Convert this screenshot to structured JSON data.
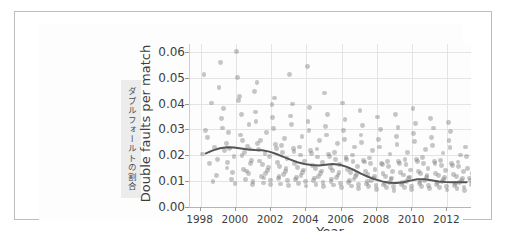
{
  "figure": {
    "side_caption": "ダブルフォールトの割合"
  },
  "chart_data": {
    "type": "scatter",
    "title": "",
    "xlabel": "Year",
    "ylabel": "Double faults per match",
    "xlim": [
      1997.4,
      2013.4
    ],
    "ylim": [
      0.0,
      0.063
    ],
    "grid": true,
    "legend": null,
    "xticks": [
      1998,
      2000,
      2002,
      2004,
      2006,
      2008,
      2010,
      2012
    ],
    "xtick_labels": [
      "1998",
      "2000",
      "2002",
      "2004",
      "2006",
      "2008",
      "2010",
      "2012"
    ],
    "yticks": [
      0.0,
      0.01,
      0.02,
      0.03,
      0.04,
      0.05,
      0.06
    ],
    "ytick_labels": [
      "0.00",
      "0.01",
      "0.02",
      "0.03",
      "0.04",
      "0.05",
      "0.06"
    ],
    "marker_color": "#787878",
    "marker_alpha": 0.42,
    "trend_color": "#555555",
    "series": [
      {
        "name": "Double faults per match",
        "x": [
          1998.1,
          1998.3,
          1998.5,
          1998.6,
          1998.8,
          1998.9,
          1998.2,
          1998.7,
          1998.4,
          1998.95,
          1999.05,
          1999.2,
          1999.35,
          1999.5,
          1999.6,
          1999.75,
          1999.9,
          1999.15,
          1999.45,
          1999.8,
          1999.3,
          1999.55,
          1999.95,
          1999.25,
          1999.65,
          2000.05,
          2000.15,
          2000.25,
          2000.35,
          2000.45,
          2000.55,
          2000.65,
          2000.75,
          2000.85,
          2000.95,
          2000.1,
          2000.3,
          2000.5,
          2000.7,
          2000.9,
          2000.2,
          2000.4,
          2000.6,
          2000.8,
          2000.98,
          2001.05,
          2001.15,
          2001.25,
          2001.35,
          2001.45,
          2001.55,
          2001.65,
          2001.75,
          2001.85,
          2001.95,
          2001.1,
          2001.3,
          2001.5,
          2001.7,
          2001.9,
          2001.2,
          2001.6,
          2001.4,
          2001.8,
          2001.98,
          2002.05,
          2002.15,
          2002.25,
          2002.35,
          2002.45,
          2002.55,
          2002.65,
          2002.75,
          2002.85,
          2002.95,
          2002.1,
          2002.3,
          2002.5,
          2002.7,
          2002.9,
          2002.2,
          2002.4,
          2002.6,
          2002.8,
          2002.98,
          2003.05,
          2003.15,
          2003.25,
          2003.35,
          2003.45,
          2003.55,
          2003.65,
          2003.75,
          2003.85,
          2003.95,
          2003.1,
          2003.3,
          2003.5,
          2003.7,
          2003.9,
          2003.2,
          2003.4,
          2003.6,
          2003.8,
          2003.98,
          2004.05,
          2004.15,
          2004.25,
          2004.35,
          2004.45,
          2004.55,
          2004.65,
          2004.75,
          2004.85,
          2004.95,
          2004.1,
          2004.3,
          2004.5,
          2004.7,
          2004.9,
          2004.2,
          2004.4,
          2004.6,
          2004.8,
          2004.98,
          2005.05,
          2005.15,
          2005.25,
          2005.35,
          2005.45,
          2005.55,
          2005.65,
          2005.75,
          2005.85,
          2005.95,
          2005.1,
          2005.3,
          2005.5,
          2005.7,
          2005.9,
          2005.2,
          2005.4,
          2005.6,
          2005.8,
          2005.98,
          2006.05,
          2006.15,
          2006.25,
          2006.35,
          2006.45,
          2006.55,
          2006.65,
          2006.75,
          2006.85,
          2006.95,
          2006.1,
          2006.3,
          2006.5,
          2006.7,
          2006.9,
          2006.2,
          2006.4,
          2006.6,
          2006.8,
          2006.98,
          2007.05,
          2007.15,
          2007.25,
          2007.35,
          2007.45,
          2007.55,
          2007.65,
          2007.75,
          2007.85,
          2007.95,
          2007.1,
          2007.3,
          2007.5,
          2007.7,
          2007.9,
          2007.2,
          2007.4,
          2007.6,
          2007.8,
          2007.98,
          2008.05,
          2008.15,
          2008.25,
          2008.35,
          2008.45,
          2008.55,
          2008.65,
          2008.75,
          2008.85,
          2008.95,
          2008.1,
          2008.3,
          2008.5,
          2008.7,
          2008.9,
          2008.2,
          2008.4,
          2008.6,
          2008.8,
          2008.98,
          2009.05,
          2009.15,
          2009.25,
          2009.35,
          2009.45,
          2009.55,
          2009.65,
          2009.75,
          2009.85,
          2009.95,
          2009.1,
          2009.3,
          2009.5,
          2009.7,
          2009.9,
          2009.2,
          2009.4,
          2009.6,
          2009.8,
          2009.98,
          2010.05,
          2010.15,
          2010.25,
          2010.35,
          2010.45,
          2010.55,
          2010.65,
          2010.75,
          2010.85,
          2010.95,
          2010.1,
          2010.3,
          2010.5,
          2010.7,
          2010.9,
          2010.2,
          2010.4,
          2010.6,
          2010.8,
          2010.98,
          2011.05,
          2011.15,
          2011.25,
          2011.35,
          2011.45,
          2011.55,
          2011.65,
          2011.75,
          2011.85,
          2011.95,
          2011.1,
          2011.3,
          2011.5,
          2011.7,
          2011.9,
          2011.2,
          2011.4,
          2011.6,
          2011.8,
          2011.98,
          2012.05,
          2012.15,
          2012.25,
          2012.35,
          2012.45,
          2012.55,
          2012.65,
          2012.75,
          2012.85,
          2012.95,
          2012.1,
          2012.3,
          2012.5,
          2012.7,
          2012.9,
          2012.2,
          2012.4,
          2012.6,
          2012.8,
          2012.98,
          2013.05,
          2013.15,
          2013.25,
          2013.35,
          2013.45,
          2013.1,
          2013.3
        ],
        "y": [
          0.0205,
          0.0295,
          0.0167,
          0.0402,
          0.0231,
          0.0123,
          0.0512,
          0.0098,
          0.0268,
          0.0185,
          0.0462,
          0.0342,
          0.0218,
          0.0151,
          0.0289,
          0.0107,
          0.0196,
          0.0558,
          0.0246,
          0.0134,
          0.0381,
          0.0172,
          0.0091,
          0.0305,
          0.0225,
          0.0601,
          0.0412,
          0.0278,
          0.0199,
          0.0145,
          0.0106,
          0.0235,
          0.0318,
          0.0168,
          0.0087,
          0.0502,
          0.0356,
          0.0212,
          0.0128,
          0.0181,
          0.0428,
          0.0256,
          0.0139,
          0.0224,
          0.0098,
          0.0445,
          0.0331,
          0.0245,
          0.0178,
          0.0119,
          0.0093,
          0.0208,
          0.0289,
          0.0152,
          0.0104,
          0.0367,
          0.0221,
          0.0163,
          0.0131,
          0.0195,
          0.0482,
          0.0112,
          0.0258,
          0.0142,
          0.0086,
          0.0395,
          0.0302,
          0.0241,
          0.0173,
          0.0118,
          0.0089,
          0.0212,
          0.0265,
          0.0148,
          0.0101,
          0.0345,
          0.0226,
          0.0158,
          0.0126,
          0.0187,
          0.0421,
          0.0109,
          0.0238,
          0.0137,
          0.0083,
          0.0512,
          0.0318,
          0.0226,
          0.0169,
          0.0115,
          0.0092,
          0.0201,
          0.0271,
          0.0143,
          0.0098,
          0.0352,
          0.0215,
          0.0154,
          0.0122,
          0.0178,
          0.0398,
          0.0106,
          0.0232,
          0.0134,
          0.0081,
          0.0542,
          0.0296,
          0.0218,
          0.0161,
          0.0112,
          0.0088,
          0.0193,
          0.0258,
          0.0139,
          0.0095,
          0.0331,
          0.0206,
          0.0148,
          0.0118,
          0.0171,
          0.0386,
          0.0102,
          0.0224,
          0.0129,
          0.0079,
          0.0441,
          0.0278,
          0.0205,
          0.0152,
          0.0108,
          0.0085,
          0.0184,
          0.0246,
          0.0132,
          0.0091,
          0.0312,
          0.0196,
          0.0141,
          0.0113,
          0.0163,
          0.0358,
          0.0098,
          0.0212,
          0.0124,
          0.0076,
          0.0402,
          0.0262,
          0.0192,
          0.0144,
          0.0103,
          0.0081,
          0.0176,
          0.0232,
          0.0126,
          0.0087,
          0.0295,
          0.0185,
          0.0134,
          0.0108,
          0.0155,
          0.0338,
          0.0094,
          0.0201,
          0.0118,
          0.0073,
          0.0372,
          0.0248,
          0.0181,
          0.0136,
          0.0098,
          0.0078,
          0.0167,
          0.0218,
          0.0119,
          0.0083,
          0.0278,
          0.0174,
          0.0127,
          0.0102,
          0.0146,
          0.0316,
          0.0089,
          0.0189,
          0.0112,
          0.0069,
          0.0348,
          0.0232,
          0.0169,
          0.0128,
          0.0093,
          0.0074,
          0.0158,
          0.0205,
          0.0112,
          0.0079,
          0.0261,
          0.0163,
          0.0119,
          0.0096,
          0.0138,
          0.0298,
          0.0085,
          0.0177,
          0.0105,
          0.0065,
          0.0358,
          0.0241,
          0.0176,
          0.0132,
          0.0096,
          0.0076,
          0.0163,
          0.0212,
          0.0116,
          0.0081,
          0.0271,
          0.0169,
          0.0124,
          0.0099,
          0.0143,
          0.0308,
          0.0087,
          0.0183,
          0.0109,
          0.0067,
          0.0382,
          0.0252,
          0.0184,
          0.0138,
          0.0099,
          0.0078,
          0.0169,
          0.0221,
          0.0121,
          0.0084,
          0.0283,
          0.0176,
          0.0129,
          0.0103,
          0.0148,
          0.0322,
          0.009,
          0.0191,
          0.0113,
          0.007,
          0.0341,
          0.0238,
          0.0175,
          0.0131,
          0.0095,
          0.0075,
          0.0161,
          0.0209,
          0.0114,
          0.008,
          0.0268,
          0.0167,
          0.0122,
          0.0098,
          0.0141,
          0.0305,
          0.0086,
          0.0181,
          0.0107,
          0.0066,
          0.0328,
          0.0229,
          0.0168,
          0.0126,
          0.0092,
          0.0072,
          0.0155,
          0.0201,
          0.011,
          0.0077,
          0.0258,
          0.0161,
          0.0118,
          0.0094,
          0.0136,
          0.0293,
          0.0083,
          0.0174,
          0.0103,
          0.0064,
          0.0232,
          0.0148,
          0.0112,
          0.0088,
          0.0128,
          0.0196,
          0.0101
        ]
      }
    ],
    "trend_line": {
      "name": "smoothed trend",
      "x": [
        1998.3,
        1998.7,
        1999.1,
        1999.5,
        1999.9,
        2000.3,
        2000.7,
        2001.1,
        2001.5,
        2001.9,
        2002.3,
        2002.7,
        2003.1,
        2003.5,
        2003.9,
        2004.3,
        2004.7,
        2005.1,
        2005.5,
        2005.9,
        2006.3,
        2006.7,
        2007.1,
        2007.5,
        2007.9,
        2008.3,
        2008.7,
        2009.1,
        2009.5,
        2009.9,
        2010.3,
        2010.7,
        2011.1,
        2011.5,
        2011.9,
        2012.3,
        2012.7,
        2013.1
      ],
      "y": [
        0.0207,
        0.0219,
        0.0227,
        0.0231,
        0.023,
        0.0226,
        0.0222,
        0.022,
        0.0219,
        0.0214,
        0.0205,
        0.0194,
        0.0183,
        0.0173,
        0.0166,
        0.0162,
        0.016,
        0.0163,
        0.0166,
        0.0163,
        0.0155,
        0.0143,
        0.0129,
        0.0117,
        0.0107,
        0.0099,
        0.0094,
        0.0093,
        0.0096,
        0.0102,
        0.0107,
        0.0107,
        0.0103,
        0.0099,
        0.0097,
        0.0096,
        0.0096,
        0.0096
      ]
    }
  }
}
